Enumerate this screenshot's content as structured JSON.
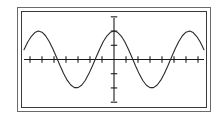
{
  "figure": {
    "title": "",
    "frame_style": "double-rule-rectangle",
    "outer_border_color": "#6a6a6a",
    "inner_border_color": "#3a3a3a",
    "background_color": "#ffffff",
    "curve_color": "#2a2a2a",
    "axis_color": "#1a1a1a"
  },
  "chart_data": {
    "type": "line",
    "title": "",
    "xlabel": "",
    "ylabel": "",
    "grid": false,
    "legend": null,
    "function": "y = A*cos(x)",
    "amplitude": 1,
    "period": 6.283,
    "xlim": [
      -7.5,
      7.5
    ],
    "ylim": [
      -1.6,
      1.6
    ],
    "x_axis": {
      "position_y": 0,
      "tick_count": 15,
      "tick_values": [
        -7,
        -6,
        -5,
        -4,
        -3,
        -2,
        -1,
        0,
        1,
        2,
        3,
        4,
        5,
        6,
        7
      ],
      "tick_labels": []
    },
    "y_axis": {
      "position_x": 0,
      "tick_count": 6,
      "tick_values": [
        -1.5,
        -1.0,
        -0.5,
        0.5,
        1.0,
        1.5
      ],
      "tick_labels": []
    },
    "series": [
      {
        "name": "cosine-wave",
        "color": "#2a2a2a",
        "x": [
          -7.5,
          -7.2,
          -6.9,
          -6.6,
          -6.3,
          -6.0,
          -5.7,
          -5.4,
          -5.1,
          -4.8,
          -4.5,
          -4.2,
          -3.9,
          -3.6,
          -3.3,
          -3.0,
          -2.7,
          -2.4,
          -2.1,
          -1.8,
          -1.5,
          -1.2,
          -0.9,
          -0.6,
          -0.3,
          0.0,
          0.3,
          0.6,
          0.9,
          1.2,
          1.5,
          1.8,
          2.1,
          2.4,
          2.7,
          3.0,
          3.3,
          3.6,
          3.9,
          4.2,
          4.5,
          4.8,
          5.1,
          5.4,
          5.7,
          6.0,
          6.3,
          6.6,
          6.9,
          7.2,
          7.5
        ],
        "y": [
          0.3466,
          0.6084,
          0.8085,
          0.9477,
          1.0,
          0.96,
          0.8347,
          0.6347,
          0.378,
          0.0875,
          -0.2108,
          -0.4903,
          -0.7259,
          -0.8968,
          -0.9874,
          -0.99,
          -0.9041,
          -0.7374,
          -0.5048,
          -0.2272,
          0.0707,
          0.3624,
          0.6216,
          0.8253,
          0.9553,
          1.0,
          0.9553,
          0.8253,
          0.6216,
          0.3624,
          0.0707,
          -0.2272,
          -0.5048,
          -0.7374,
          -0.9041,
          -0.99,
          -0.9874,
          -0.8968,
          -0.7259,
          -0.4903,
          -0.2108,
          0.0875,
          0.378,
          0.6347,
          0.8347,
          0.96,
          1.0,
          0.9477,
          0.8085,
          0.6084,
          0.3466
        ]
      }
    ],
    "peaks": [
      {
        "x": -6.283,
        "y": 1.0
      },
      {
        "x": 0.0,
        "y": 1.0
      },
      {
        "x": 6.283,
        "y": 1.0
      }
    ],
    "troughs": [
      {
        "x": -3.1416,
        "y": -1.0
      },
      {
        "x": 3.1416,
        "y": -1.0
      }
    ]
  }
}
